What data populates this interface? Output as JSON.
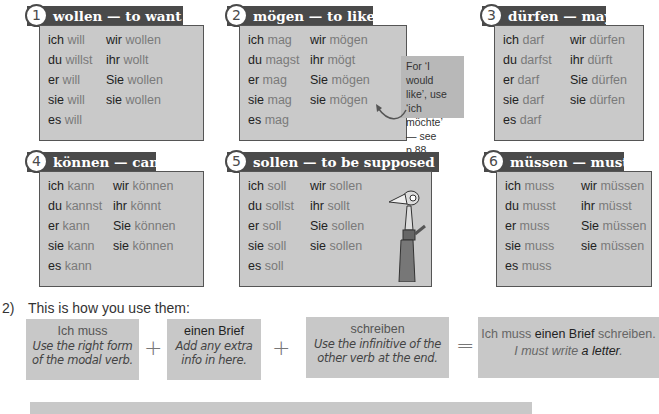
{
  "verbs": [
    {
      "num": "1",
      "title": "wollen — to want",
      "rows": [
        [
          "ich",
          "will",
          "wir",
          "wollen"
        ],
        [
          "du",
          "willst",
          "ihr",
          "wollt"
        ],
        [
          "er",
          "will",
          "Sie",
          "wollen"
        ],
        [
          "sie",
          "will",
          "sie",
          "wollen"
        ],
        [
          "es",
          "will",
          "",
          ""
        ]
      ]
    },
    {
      "num": "2",
      "title": "mögen — to like",
      "rows": [
        [
          "ich",
          "mag",
          "wir",
          "mögen"
        ],
        [
          "du",
          "magst",
          "ihr",
          "mögt"
        ],
        [
          "er",
          "mag",
          "Sie",
          "mögen"
        ],
        [
          "sie",
          "mag",
          "sie",
          "mögen"
        ],
        [
          "es",
          "mag",
          "",
          ""
        ]
      ]
    },
    {
      "num": "3",
      "title": "dürfen — may",
      "rows": [
        [
          "ich",
          "darf",
          "wir",
          "dürfen"
        ],
        [
          "du",
          "darfst",
          "ihr",
          "dürft"
        ],
        [
          "er",
          "darf",
          "Sie",
          "dürfen"
        ],
        [
          "sie",
          "darf",
          "sie",
          "dürfen"
        ],
        [
          "es",
          "darf",
          "",
          ""
        ]
      ]
    },
    {
      "num": "4",
      "title": "können — can",
      "rows": [
        [
          "ich",
          "kann",
          "wir",
          "können"
        ],
        [
          "du",
          "kannst",
          "ihr",
          "könnt"
        ],
        [
          "er",
          "kann",
          "Sie",
          "können"
        ],
        [
          "sie",
          "kann",
          "sie",
          "können"
        ],
        [
          "es",
          "kann",
          "",
          ""
        ]
      ]
    },
    {
      "num": "5",
      "title": "sollen — to be supposed to",
      "rows": [
        [
          "ich",
          "soll",
          "wir",
          "sollen"
        ],
        [
          "du",
          "sollst",
          "ihr",
          "sollt"
        ],
        [
          "er",
          "soll",
          "Sie",
          "sollen"
        ],
        [
          "sie",
          "soll",
          "sie",
          "sollen"
        ],
        [
          "es",
          "soll",
          "",
          ""
        ]
      ]
    },
    {
      "num": "6",
      "title": "müssen — must",
      "rows": [
        [
          "ich",
          "muss",
          "wir",
          "müssen"
        ],
        [
          "du",
          "musst",
          "ihr",
          "müsst"
        ],
        [
          "er",
          "muss",
          "Sie",
          "müssen"
        ],
        [
          "sie",
          "muss",
          "sie",
          "müssen"
        ],
        [
          "es",
          "muss",
          "",
          ""
        ]
      ]
    }
  ],
  "note": {
    "line1": "For ‘I would",
    "line2": "like’, use",
    "line3": "‘ich möchte’",
    "line4": "— see p.88."
  },
  "how": {
    "number": "2)",
    "text": "This is how you use them:"
  },
  "formula": {
    "part1": {
      "main": "Ich muss",
      "sub1": "Use the right form",
      "sub2": "of the modal verb."
    },
    "plus1": "+",
    "part2": {
      "main": "einen Brief",
      "sub1": "Add any extra",
      "sub2": "info in here."
    },
    "plus2": "+",
    "part3": {
      "main": "schreiben",
      "sub1": "Use the infinitive of the",
      "sub2": "other verb at the end."
    },
    "equals": "=",
    "result": {
      "a": "Ich muss ",
      "b": "einen Brief",
      "c": " schreiben.",
      "d": "I must write ",
      "e": "a letter",
      "f": "."
    }
  },
  "colors": {
    "header_bg": "#4a4a4a",
    "box_bg": "#c9c9c9",
    "note_bg": "#b8b8b8",
    "formula_bg": "#c8c8c8"
  }
}
